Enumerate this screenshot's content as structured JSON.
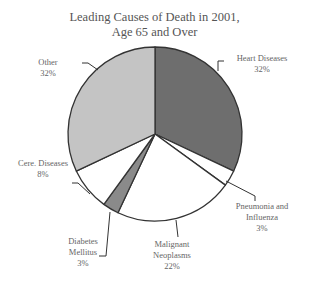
{
  "chart_data": {
    "type": "pie",
    "title_lines": [
      "Leading Causes of Death in 2001,",
      "Age 65 and Over"
    ],
    "categories": [
      "Heart Diseases",
      "Pneumonia and Influenza",
      "Malignant Neoplasms",
      "Diabetes Mellitus",
      "Cere. Diseases",
      "Other"
    ],
    "values": [
      32,
      3,
      22,
      3,
      8,
      32
    ],
    "unit": "%",
    "colors": [
      "#6e6e6e",
      "#ffffff",
      "#ffffff",
      "#8a8a8a",
      "#ffffff",
      "#c4c4c4"
    ],
    "start_angle_deg": 0,
    "direction": "clockwise",
    "legend": "none (callout labels)",
    "grid": false
  },
  "labels": {
    "heart": {
      "name": "Heart Diseases",
      "pct": "32%"
    },
    "pneumonia": {
      "line1": "Pneumonia and",
      "line2": "Influenza",
      "pct": "3%"
    },
    "malignant": {
      "line1": "Malignant",
      "line2": "Neoplasms",
      "pct": "22%"
    },
    "diabetes": {
      "line1": "Diabetes",
      "line2": "Mellitus",
      "pct": "3%"
    },
    "cere": {
      "name": "Cere. Diseases",
      "pct": "8%"
    },
    "other": {
      "name": "Other",
      "pct": "32%"
    }
  }
}
